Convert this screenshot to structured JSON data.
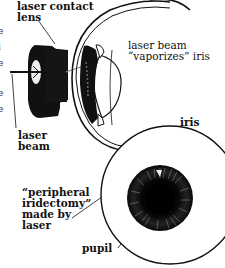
{
  "figure": {
    "type": "medical-illustration",
    "colors": {
      "ink": "#111111",
      "background": "#ffffff"
    }
  },
  "labels": {
    "contact_lens": "laser contact\nlens",
    "laser_beam_left": "laser\nbeam",
    "vaporizes": "laser beam\n“vaporizes” iris",
    "iris": "iris",
    "iridectomy": "“peripheral\niridectomy”\nmade by\nlaser",
    "pupil": "pupil"
  },
  "left_edge_fragments": [
    "e",
    "l",
    "e",
    "e",
    "e",
    "l",
    "y",
    "s",
    "l",
    "e",
    "s"
  ]
}
